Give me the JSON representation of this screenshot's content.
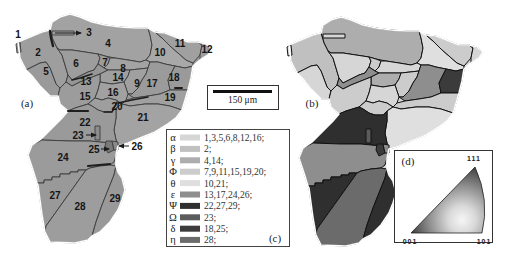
{
  "panel_a": {
    "label": "(a)",
    "grains": [
      "1",
      "2",
      "3",
      "4",
      "5",
      "6",
      "7",
      "8",
      "9",
      "10",
      "11",
      "12",
      "13",
      "14",
      "15",
      "16",
      "17",
      "18",
      "19",
      "20",
      "21",
      "22",
      "23",
      "24",
      "25",
      "26",
      "27",
      "28",
      "29"
    ]
  },
  "panel_b": {
    "label": "(b)"
  },
  "scale_bar": {
    "label": "150 μm"
  },
  "legend": {
    "label": "(c)",
    "rows": [
      {
        "symbol": "α",
        "grains": "1,3,5,6,8,12,16;",
        "color": "#d6d6d6"
      },
      {
        "symbol": "β",
        "grains": "2;",
        "color": "#c0c0c0"
      },
      {
        "symbol": "γ",
        "grains": "4,14;",
        "color": "#adadad"
      },
      {
        "symbol": "Φ",
        "grains": "7,9,11,15,19,20;",
        "color": "#cccccc"
      },
      {
        "symbol": "θ",
        "grains": "10,21;",
        "color": "#dfdfdf"
      },
      {
        "symbol": "ε",
        "grains": "13,17,24,26;",
        "color": "#8e8e8e"
      },
      {
        "symbol": "Ψ",
        "grains": "22,27,29;",
        "color": "#2f2f2f"
      },
      {
        "symbol": "Ω",
        "grains": "23;",
        "color": "#5c5c5c"
      },
      {
        "symbol": "δ",
        "grains": "18,25;",
        "color": "#3b3b3b"
      },
      {
        "symbol": "η",
        "grains": "28;",
        "color": "#6b6b6b"
      }
    ]
  },
  "ipf": {
    "label": "(d)",
    "corner_top": "111",
    "corner_bottom_left": "001",
    "corner_bottom_right": "101"
  }
}
